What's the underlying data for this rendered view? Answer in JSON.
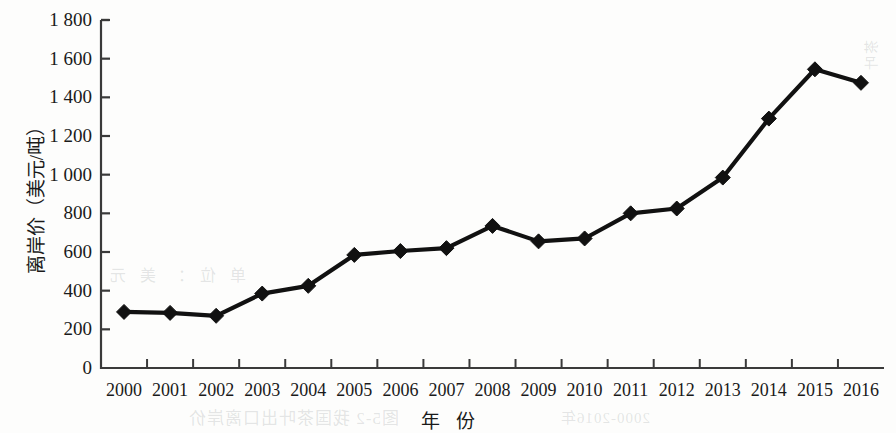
{
  "chart_data": {
    "type": "line",
    "title": "",
    "xlabel": "年  份",
    "ylabel": "离岸价（美元/吨）",
    "categories": [
      "2000",
      "2001",
      "2002",
      "2003",
      "2004",
      "2005",
      "2006",
      "2007",
      "2008",
      "2009",
      "2010",
      "2011",
      "2012",
      "2013",
      "2014",
      "2015",
      "2016"
    ],
    "values": [
      290,
      285,
      270,
      385,
      425,
      585,
      605,
      620,
      735,
      655,
      670,
      800,
      825,
      985,
      1290,
      1545,
      1475
    ],
    "series": [
      {
        "name": "离岸价",
        "values": [
          290,
          285,
          270,
          385,
          425,
          585,
          605,
          620,
          735,
          655,
          670,
          800,
          825,
          985,
          1290,
          1545,
          1475
        ]
      }
    ],
    "ylim": [
      0,
      1800
    ],
    "ytick_values": [
      0,
      200,
      400,
      600,
      800,
      1000,
      1200,
      1400,
      1600,
      1800
    ],
    "ytick_labels": [
      "0",
      "200",
      "400",
      "600",
      "800",
      "1 000",
      "1 200",
      "1 400",
      "1 600",
      "1 800"
    ],
    "grid": false,
    "legend": "none",
    "marker": "diamond",
    "line_color": "#111111",
    "marker_color": "#111111",
    "axis_color": "#3a3a3a"
  },
  "axes": {
    "y_title": "离岸价（美元/吨）",
    "x_title": "年  份"
  },
  "artifacts": {
    "showthrough_1": "图5-2  我国茶叶出口离岸价",
    "showthrough_2": "2000-2016年",
    "showthrough_3": "单位：美元",
    "showthrough_4": "茶叶"
  }
}
